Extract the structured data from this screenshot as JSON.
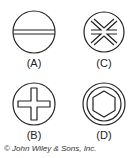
{
  "figures": [
    {
      "id": "A",
      "label": "(A)",
      "type": "slotted"
    },
    {
      "id": "B",
      "label": "(B)",
      "type": "phillips"
    },
    {
      "id": "C",
      "label": "(C)",
      "type": "pozidriv"
    },
    {
      "id": "D",
      "label": "(D)",
      "type": "hex-socket"
    }
  ],
  "copyright": "© John Wiley & Sons, Inc."
}
